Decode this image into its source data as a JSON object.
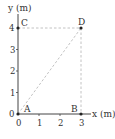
{
  "diagram": {
    "y_axis_label": "y (m)",
    "x_axis_label": "x (m)",
    "x_ticks": [
      "0",
      "1",
      "2",
      "3"
    ],
    "y_ticks": [
      "0",
      "1",
      "2",
      "3",
      "4"
    ],
    "points": {
      "A": {
        "label": "A",
        "x": 0,
        "y": 0
      },
      "B": {
        "label": "B",
        "x": 3,
        "y": 0
      },
      "C": {
        "label": "C",
        "x": 0,
        "y": 4
      },
      "D": {
        "label": "D",
        "x": 3,
        "y": 4
      }
    },
    "dashed_lines": [
      "C-D",
      "D-B",
      "A-D"
    ],
    "colors": {
      "axis": "#444444",
      "dashed": "#bbbbbb",
      "point": "#222222"
    }
  }
}
